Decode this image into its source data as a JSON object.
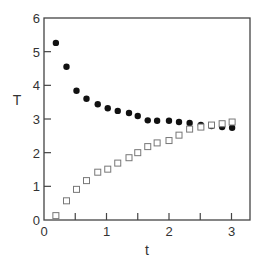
{
  "chart_data": {
    "type": "scatter",
    "title": "",
    "xlabel": "t",
    "ylabel": "T",
    "xlim": [
      0,
      3.3
    ],
    "ylim": [
      0,
      6
    ],
    "xticks": [
      0,
      0.5,
      1,
      1.5,
      2,
      2.5,
      3
    ],
    "xtick_labels": [
      "0",
      "",
      "1",
      "",
      "2",
      "",
      "3"
    ],
    "yticks": [
      0,
      1,
      2,
      3,
      4,
      5,
      6
    ],
    "ytick_labels": [
      "0",
      "1",
      "2",
      "3",
      "4",
      "5",
      "6"
    ],
    "grid": false,
    "legend": "none",
    "series": [
      {
        "name": "filled-circles",
        "marker": "filled-circle",
        "color": "#111111",
        "x": [
          0.19,
          0.36,
          0.52,
          0.68,
          0.86,
          1.02,
          1.18,
          1.36,
          1.5,
          1.66,
          1.81,
          2.0,
          2.16,
          2.33,
          2.51,
          2.68,
          2.85,
          3.01
        ],
        "y": [
          5.26,
          4.55,
          3.84,
          3.6,
          3.44,
          3.32,
          3.24,
          3.18,
          3.09,
          2.96,
          2.95,
          2.95,
          2.91,
          2.88,
          2.82,
          2.79,
          2.76,
          2.74
        ]
      },
      {
        "name": "open-squares",
        "marker": "open-square",
        "color": "#777777",
        "x": [
          0.19,
          0.36,
          0.52,
          0.68,
          0.86,
          1.02,
          1.18,
          1.36,
          1.5,
          1.66,
          1.81,
          2.0,
          2.16,
          2.33,
          2.51,
          2.68,
          2.85,
          3.01
        ],
        "y": [
          0.13,
          0.57,
          0.91,
          1.17,
          1.42,
          1.51,
          1.69,
          1.85,
          2.0,
          2.18,
          2.29,
          2.36,
          2.52,
          2.7,
          2.76,
          2.82,
          2.86,
          2.91
        ]
      }
    ]
  }
}
